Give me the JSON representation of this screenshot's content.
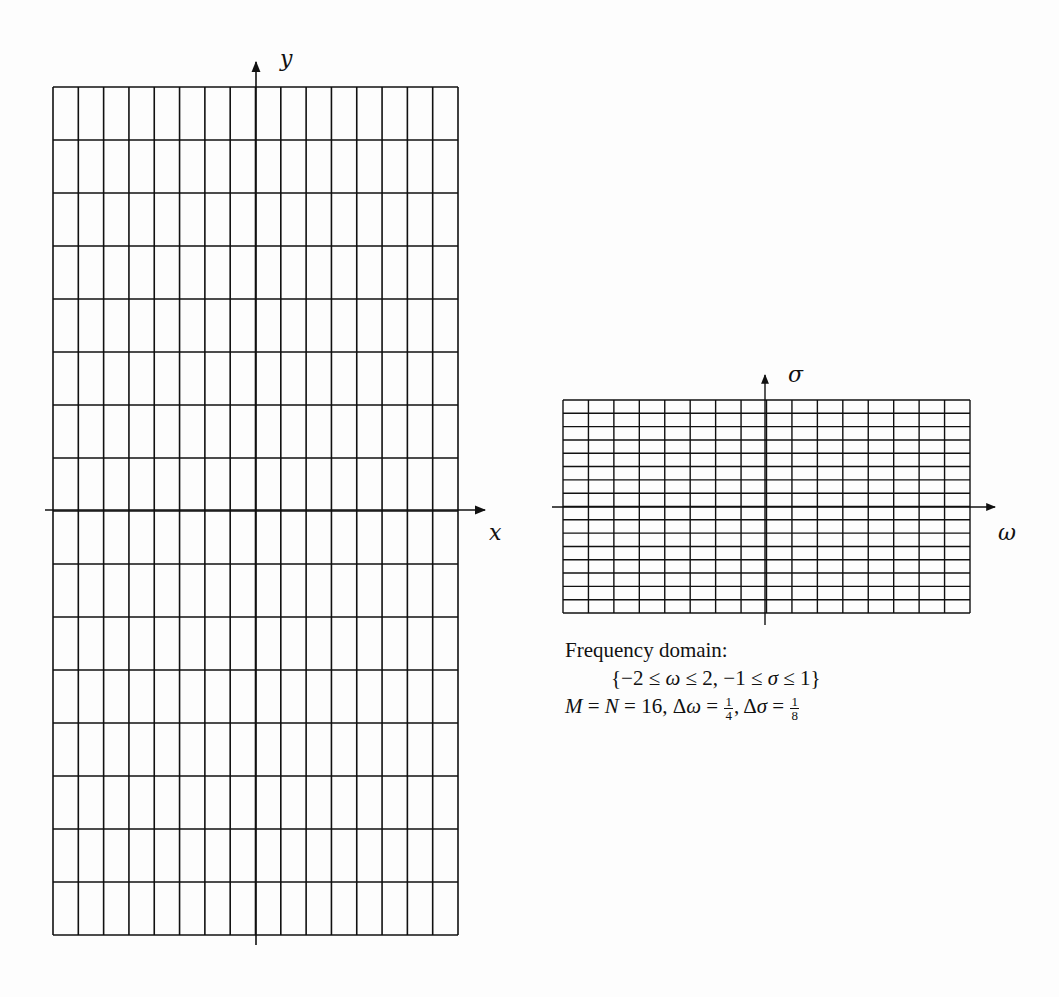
{
  "spatial_domain": {
    "x_axis_label": "x",
    "y_axis_label": "y",
    "grid": {
      "columns": 16,
      "rows": 16
    }
  },
  "frequency_domain": {
    "horizontal_axis_label": "ω",
    "vertical_axis_label": "σ",
    "grid": {
      "columns": 16,
      "rows": 16
    },
    "caption": {
      "title": "Frequency domain:",
      "range_open": "{−2 ≤ ",
      "omega": "ω",
      "range_mid": " ≤ 2,  −1 ≤ ",
      "sigma": "σ",
      "range_close": " ≤ 1}",
      "M": "M",
      "eq1": " = ",
      "N": "N",
      "eq2": " = 16,  Δ",
      "omega2": "ω",
      "eq3": " = ",
      "d_omega_num": "1",
      "d_omega_den": "4",
      "comma": ",  Δ",
      "sigma2": "σ",
      "eq4": " = ",
      "d_sigma_num": "1",
      "d_sigma_den": "8"
    }
  },
  "colors": {
    "ink": "#111111",
    "paper": "#fdfdfd"
  }
}
